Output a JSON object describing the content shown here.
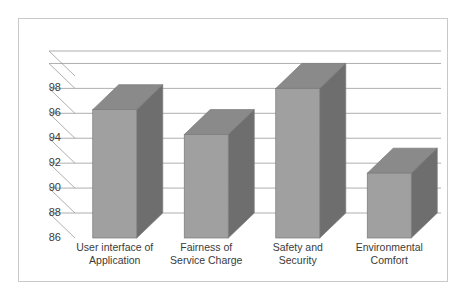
{
  "chart_data": {
    "type": "bar",
    "render_style": "3d-column",
    "title": "",
    "subtitle": "",
    "xlabel": "",
    "ylabel": "",
    "categories": [
      "User interface of Application",
      "Fairness of Service Charge",
      "Safety and Security",
      "Environmental Comfort"
    ],
    "category_lines": [
      [
        "User interface of",
        "Application"
      ],
      [
        "Fairness of",
        "Service Charge"
      ],
      [
        "Safety and",
        "Security"
      ],
      [
        "Environmental",
        "Comfort"
      ]
    ],
    "values": [
      96.3,
      94.3,
      98.0,
      91.2
    ],
    "series": [
      {
        "name": "",
        "values": [
          96.3,
          94.3,
          98.0,
          91.2
        ]
      }
    ],
    "ylim": [
      86,
      99
    ],
    "yticks": [
      86,
      88,
      90,
      92,
      94,
      96,
      98
    ],
    "ytick_labels": [
      "86",
      "88",
      "90",
      "92",
      "94",
      "96",
      "98"
    ],
    "grid": true,
    "grid_axis": "y",
    "legend": false,
    "legend_position": "none",
    "annotations": [],
    "colors": {
      "bar_front": "#a0a0a0",
      "bar_top": "#8a8a8a",
      "bar_side": "#6e6e6e",
      "bar_outline": "#7a7a7a",
      "gridline": "#9a9a9a",
      "axis_line": "#9a9a9a",
      "tick_text": "#3b3b3b",
      "plot_background": "#ffffff",
      "frame_border": "#c9c9c9",
      "page_background": "#ffffff"
    }
  }
}
